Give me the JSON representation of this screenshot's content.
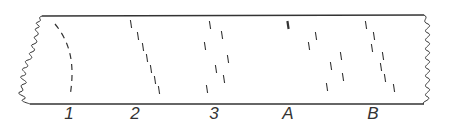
{
  "diagram": {
    "ink_color": "#333333",
    "background": "#ffffff",
    "strip": {
      "top_y": 16,
      "bottom_y": 104,
      "left_x": 42,
      "right_x": 424
    },
    "lanes": [
      {
        "label": "1",
        "label_x": 69,
        "pattern": "curved dashed line (arc)"
      },
      {
        "label": "2",
        "label_x": 135,
        "dashes": [
          [
            131,
            24
          ],
          [
            138,
            36
          ],
          [
            143,
            47
          ],
          [
            147,
            58
          ],
          [
            151,
            69
          ],
          [
            155,
            80
          ],
          [
            159,
            90
          ]
        ]
      },
      {
        "label": "3",
        "label_x": 214,
        "dashes": [
          [
            210,
            25
          ],
          [
            222,
            35
          ],
          [
            205,
            46
          ],
          [
            228,
            59
          ],
          [
            216,
            69
          ],
          [
            224,
            79
          ],
          [
            207,
            89
          ]
        ]
      },
      {
        "label": "A",
        "label_x": 288,
        "dashes": [
          [
            288,
            25
          ],
          [
            316,
            36
          ],
          [
            309,
            46
          ],
          [
            341,
            56
          ],
          [
            331,
            66
          ],
          [
            343,
            77
          ],
          [
            327,
            87
          ]
        ]
      },
      {
        "label": "B",
        "label_x": 373,
        "dashes": [
          [
            366,
            25
          ],
          [
            374,
            36
          ],
          [
            372,
            48
          ],
          [
            383,
            56
          ],
          [
            381,
            67
          ],
          [
            385,
            78
          ],
          [
            394,
            88
          ]
        ]
      }
    ]
  }
}
